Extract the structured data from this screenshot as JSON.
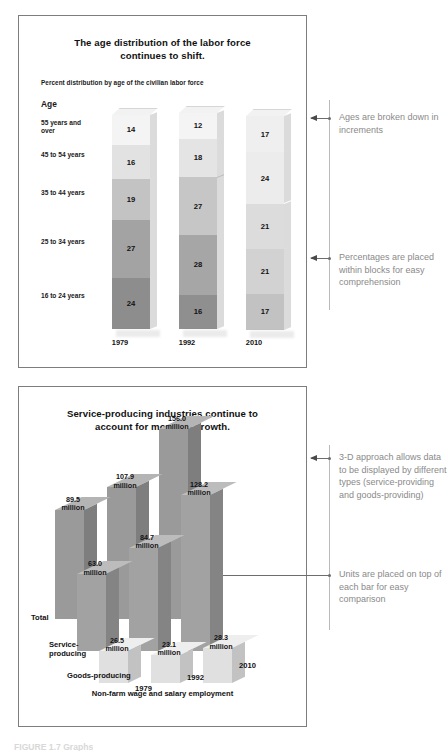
{
  "age_panel": {
    "title_line1": "The age distribution of the labor force",
    "title_line2": "continues to shift.",
    "subtitle": "Percent distribution by age of the civilian labor force",
    "axis_label": "Age",
    "annotations": [
      "Ages are broken down in increments",
      "Percentages are placed within blocks for easy comprehension"
    ]
  },
  "industry_panel": {
    "title_line1": "Service-producing industries continue to",
    "title_line2": "account for most job growth.",
    "footer": "Non-farm wage and salary employment",
    "annotations": [
      "3-D approach allows data to be displayed by different types (service-providing and goods-providing)",
      "Units are placed on top of each bar for easy comparison"
    ]
  },
  "caption": "FIGURE 1.7  Graphs",
  "colors": {
    "panel_border": "#7d7d7d",
    "annotation_text": "#8a8a8a",
    "arrow": "#4a4a4a",
    "bar_dark": "#8e8e8e",
    "bar_light": "#d9d9d9"
  },
  "chart_data": [
    {
      "type": "bar",
      "subtype": "stacked-column-3d",
      "title": "The age distribution of the labor force continues to shift.",
      "subtitle": "Percent distribution by age of the civilian labor force",
      "xlabel": "",
      "ylabel": "Age",
      "unit": "percent",
      "categories": [
        "1979",
        "1992",
        "2010"
      ],
      "stack_order_top_to_bottom": [
        "55 years and over",
        "45 to 54 years",
        "35 to 44 years",
        "25 to 34 years",
        "16 to 24 years"
      ],
      "series": [
        {
          "name": "55 years and over",
          "values": [
            14,
            12,
            17
          ]
        },
        {
          "name": "45 to 54 years",
          "values": [
            16,
            18,
            24
          ]
        },
        {
          "name": "35 to 44 years",
          "values": [
            19,
            27,
            21
          ]
        },
        {
          "name": "25 to 34 years",
          "values": [
            27,
            28,
            21
          ]
        },
        {
          "name": "16 to 24 years",
          "values": [
            24,
            16,
            17
          ]
        }
      ],
      "ylim": [
        0,
        100
      ],
      "grid": false,
      "legend": "none"
    },
    {
      "type": "bar",
      "subtype": "grouped-column-3d",
      "title": "Service-producing industries continue to account for most job growth.",
      "footer": "Non-farm wage and salary employment",
      "unit": "million",
      "categories": [
        "1979",
        "1992",
        "2010"
      ],
      "series": [
        {
          "name": "Total",
          "values": [
            89.5,
            107.9,
            156.0
          ],
          "labels": [
            "89.5 million",
            "107.9 million",
            "156.0 million"
          ]
        },
        {
          "name": "Service-producing",
          "values": [
            63.0,
            84.7,
            128.2
          ],
          "labels": [
            "63.0 million",
            "84.7 million",
            "128.2 million"
          ]
        },
        {
          "name": "Goods-producing",
          "values": [
            26.5,
            23.1,
            28.3
          ],
          "labels": [
            "26.5 million",
            "23.1 million",
            "28.3 million"
          ]
        }
      ],
      "ylim": [
        0,
        160
      ],
      "grid": false,
      "legend": "inline-axis-labels"
    }
  ],
  "age_rows": [
    {
      "label": "55 years and\nover",
      "v1979": "14",
      "v1992": "12",
      "v2010": "17"
    },
    {
      "label": "45 to 54 years",
      "v1979": "16",
      "v1992": "18",
      "v2010": "24"
    },
    {
      "label": "35 to 44 years",
      "v1979": "19",
      "v1992": "27",
      "v2010": "21"
    },
    {
      "label": "25 to 34 years",
      "v1979": "27",
      "v1992": "28",
      "v2010": "21"
    },
    {
      "label": "16 to 24 years",
      "v1979": "24",
      "v1992": "16",
      "v2010": "17"
    }
  ],
  "age_years": [
    "1979",
    "1992",
    "2010"
  ],
  "ind_years": [
    "1979",
    "1992",
    "2010"
  ],
  "ind_series_labels": [
    "Total",
    "Service-\nproducing",
    "Goods-producing"
  ],
  "ind_values": {
    "total": [
      "89.5\nmillion",
      "107.9\nmillion",
      "156.0\nmillion"
    ],
    "service": [
      "63.0\nmillion",
      "84.7\nmillion",
      "128.2\nmillion"
    ],
    "goods": [
      "26.5\nmillion",
      "23.1\nmillion",
      "28.3\nmillion"
    ]
  }
}
